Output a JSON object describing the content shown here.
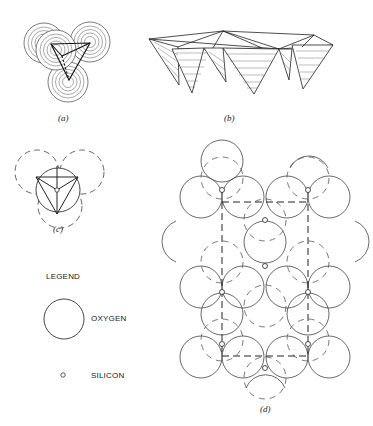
{
  "figure": {
    "panels": [
      {
        "id": "a",
        "label": "(a)",
        "description": "Silicon-oxygen tetrahedron with four oxygen spheres (concentric shading) around central silicon"
      },
      {
        "id": "b",
        "label": "(b)",
        "description": "Sheet of linked SiO4 tetrahedra in perspective, hatched faces"
      },
      {
        "id": "c",
        "label": "(c)",
        "description": "Tetrahedron plan view: solid circle with inscribed triangle, dashed oxygen circles"
      },
      {
        "id": "d",
        "label": "(d)",
        "description": "Plan view of silicate sheet: packed oxygen circles with silicon at triangle vertices, dashed unit cell rectangle"
      }
    ],
    "legend": {
      "title": "LEGEND",
      "items": [
        {
          "symbol": "large-circle",
          "label": "OXYGEN"
        },
        {
          "symbol": "small-circle",
          "label": "SILICON"
        }
      ]
    },
    "colors": {
      "stroke": "#333333",
      "background": "#ffffff"
    }
  }
}
